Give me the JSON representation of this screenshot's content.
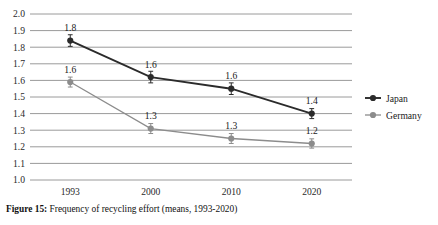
{
  "figure": {
    "number_label": "Figure 15",
    "separator": ":",
    "caption_text": "Frequency of recycling effort (means, 1993-2020)"
  },
  "legend": {
    "position": "right",
    "entries": [
      {
        "label": "Japan",
        "color": "#2b2b2b"
      },
      {
        "label": "Germany",
        "color": "#8c8c8c"
      }
    ]
  },
  "axis": {
    "y_ticks": [
      "2.0",
      "1.9",
      "1.8",
      "1.7",
      "1.6",
      "1.5",
      "1.4",
      "1.3",
      "1.2",
      "1.1",
      "1.0"
    ],
    "x_ticks": [
      "1993",
      "2000",
      "2010",
      "2020"
    ]
  },
  "chart_data": {
    "type": "line",
    "title": "",
    "subtitle": "",
    "xlabel": "",
    "ylabel": "",
    "categories": [
      "1993",
      "2000",
      "2010",
      "2020"
    ],
    "ylim": [
      1.0,
      2.0
    ],
    "ytick_step": 0.1,
    "grid": true,
    "legend_position": "right",
    "series": [
      {
        "name": "Japan",
        "color": "#2b2b2b",
        "values": [
          1.84,
          1.62,
          1.55,
          1.4
        ],
        "data_labels": [
          "1.8",
          "1.6",
          "1.6",
          "1.4"
        ],
        "error_bars": [
          0.035,
          0.035,
          0.035,
          0.03
        ]
      },
      {
        "name": "Germany",
        "color": "#8c8c8c",
        "values": [
          1.59,
          1.31,
          1.25,
          1.22
        ],
        "data_labels": [
          "1.6",
          "1.3",
          "1.3",
          "1.2"
        ],
        "error_bars": [
          0.03,
          0.03,
          0.03,
          0.028
        ]
      }
    ]
  }
}
